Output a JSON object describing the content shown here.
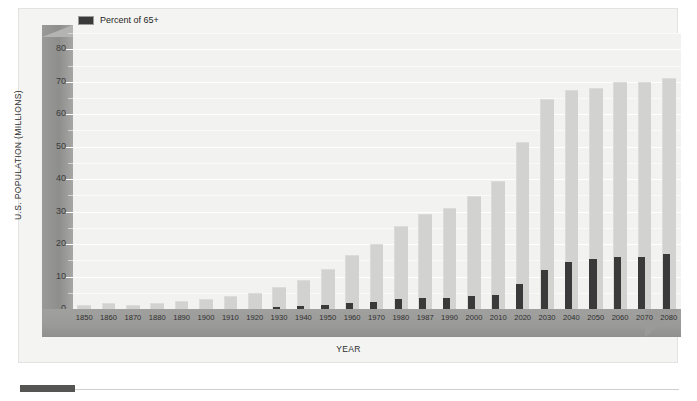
{
  "chart_data": {
    "type": "bar",
    "title": "",
    "xlabel": "YEAR",
    "ylabel": "U.S. POPULATION (MILLIONS)",
    "ylim": [
      0,
      85
    ],
    "ytick_values": [
      0,
      10,
      20,
      30,
      40,
      50,
      60,
      70,
      80
    ],
    "ytick_labels": [
      "0",
      "10",
      "20",
      "30",
      "40",
      "50",
      "60",
      "70",
      "80"
    ],
    "minor_tick_step": 5,
    "grid": true,
    "legend_position": "top-left",
    "categories": [
      "1850",
      "1860",
      "1870",
      "1880",
      "1890",
      "1900",
      "1910",
      "1920",
      "1930",
      "1940",
      "1950",
      "1960",
      "1970",
      "1980",
      "1987",
      "1990",
      "2000",
      "2010",
      "2020",
      "2030",
      "2040",
      "2050",
      "2060",
      "2070",
      "2080"
    ],
    "series": [
      {
        "name": "U.S. Population 65+",
        "color": "#d2d2d0",
        "values": [
          1.3,
          1.7,
          1.2,
          1.8,
          2.4,
          3.1,
          3.9,
          4.9,
          6.7,
          9.0,
          12.3,
          16.7,
          20.1,
          25.5,
          29.4,
          31.1,
          34.9,
          39.4,
          51.4,
          64.6,
          67.3,
          68.1,
          69.8,
          69.8,
          71.0
        ]
      },
      {
        "name": "Percent of 65+",
        "color": "#3a3a3a",
        "values": [
          0.0,
          0.0,
          0.0,
          0.0,
          0.0,
          0.0,
          0.0,
          0.0,
          0.6,
          0.9,
          1.2,
          1.9,
          2.3,
          3.2,
          3.4,
          3.5,
          4.0,
          4.4,
          7.7,
          12.1,
          14.5,
          15.4,
          15.9,
          16.0,
          17.0
        ]
      }
    ]
  },
  "legend": {
    "items": [
      {
        "label": "Percent of 65+",
        "color": "#3a3a3a"
      }
    ]
  },
  "axes": {
    "y_title": "U.S. POPULATION (MILLIONS)",
    "x_title": "YEAR"
  }
}
